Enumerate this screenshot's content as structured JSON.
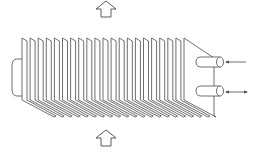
{
  "diagram": {
    "type": "finned-tube heat exchanger schematic",
    "fin_count": 21,
    "colors": {
      "stroke": "#4a4a4a",
      "fill": "#ffffff",
      "background": "#ffffff"
    },
    "elements": {
      "airflow_arrow_top": {
        "direction": "up",
        "style": "hollow block arrow"
      },
      "airflow_arrow_bottom": {
        "direction": "up",
        "style": "hollow block arrow"
      },
      "end_cap": {
        "position": "left",
        "shape": "rounded"
      },
      "pipe_upper": {
        "position": "right-upper",
        "flow_arrow": "single-headed, pointing left (inlet)"
      },
      "pipe_lower": {
        "position": "right-lower",
        "flow_arrow": "double-headed"
      }
    }
  }
}
